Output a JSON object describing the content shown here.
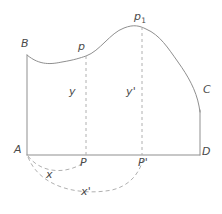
{
  "figure": {
    "stroke_color": "#8f8f8f",
    "dashed_color": "#a8a8a8",
    "label_color": "#4a4a4a",
    "background_color": "#ffffff",
    "canvas": {
      "width": 222,
      "height": 214
    }
  },
  "labels": {
    "vertex_a": "A",
    "vertex_b": "B",
    "vertex_c": "C",
    "vertex_d": "D",
    "point_p_upper": "p",
    "point_p_one": "p",
    "point_p_one_subscript": "1",
    "point_p_base": "P",
    "point_p_prime_base": "P'",
    "ordinate_y": "y",
    "ordinate_y_prime": "y'",
    "abscissa_x": "x",
    "abscissa_x_prime": "x'"
  },
  "geometry": {
    "baseline": {
      "x1": 27,
      "y1": 155,
      "x2": 200,
      "y2": 155
    },
    "left_edge": {
      "x1": 27,
      "y1": 55,
      "x2": 27,
      "y2": 155
    },
    "right_edge": {
      "x1": 200,
      "y1": 110,
      "x2": 200,
      "y2": 155
    },
    "top_curve_path": "M 27 55 C 40 66, 52 64, 62 62 C 74 60, 80 58, 86 56 C 100 51, 110 33, 124 28 C 134 24, 140 26, 146 29 C 160 35, 168 48, 178 62 C 188 76, 196 90, 199 106 L 200 112",
    "ordinate_y_line": {
      "x": 86,
      "y_top": 56,
      "y_bottom": 155
    },
    "ordinate_y_prime_line": {
      "x": 142,
      "y_top": 27,
      "y_bottom": 155
    },
    "arc_x_path": "M 28 156 C 40 172, 64 176, 85 162",
    "arc_x_prime_path": "M 28 157 C 40 188, 80 196, 112 190 C 128 186, 138 176, 143 160"
  },
  "label_positions": {
    "vertex_a": {
      "x": 14,
      "y": 150
    },
    "vertex_b": {
      "x": 21,
      "y": 38
    },
    "vertex_c": {
      "x": 203,
      "y": 84
    },
    "vertex_d": {
      "x": 202,
      "y": 150
    },
    "point_p_upper": {
      "x": 78,
      "y": 41
    },
    "point_p_one": {
      "x": 135,
      "y": 11
    },
    "point_p_base": {
      "x": 80,
      "y": 157
    },
    "point_p_prime_base": {
      "x": 138,
      "y": 157
    },
    "ordinate_y": {
      "x": 69,
      "y": 86
    },
    "ordinate_y_prime": {
      "x": 126,
      "y": 86
    },
    "abscissa_x": {
      "x": 46,
      "y": 169
    },
    "abscissa_x_prime": {
      "x": 81,
      "y": 186
    }
  }
}
